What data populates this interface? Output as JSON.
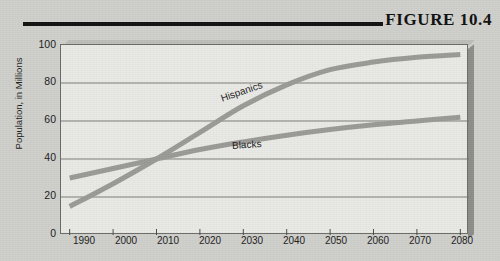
{
  "figure": {
    "title": "FIGURE 10.4"
  },
  "chart_data": {
    "type": "line",
    "title": "FIGURE 10.4",
    "xlabel": "",
    "ylabel": "Population, in Millions",
    "xlim": [
      1988,
      2082
    ],
    "ylim": [
      0,
      100
    ],
    "grid": true,
    "legend_position": "inline-labels",
    "xticks": [
      "1990",
      "2000",
      "2010",
      "2020",
      "2030",
      "2040",
      "2050",
      "2060",
      "2070",
      "2080"
    ],
    "yticks": [
      "0",
      "20",
      "40",
      "60",
      "80",
      "100"
    ],
    "x": [
      1990,
      2000,
      2010,
      2020,
      2030,
      2040,
      2050,
      2060,
      2070,
      2080
    ],
    "series": [
      {
        "name": "Hispanics",
        "color": "#9a9a97",
        "values": [
          15,
          27,
          40,
          54,
          68,
          79,
          87,
          91,
          93.5,
          95
        ]
      },
      {
        "name": "Blacks",
        "color": "#9a9a97",
        "values": [
          30,
          35,
          40,
          45,
          49,
          52.5,
          55.5,
          58,
          60,
          62
        ]
      }
    ]
  }
}
